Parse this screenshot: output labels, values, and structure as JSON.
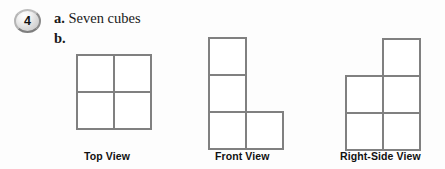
{
  "problem": {
    "number": "4",
    "part_a": {
      "marker": "a.",
      "text": "Seven cubes"
    },
    "part_b": {
      "marker": "b."
    }
  },
  "captions": {
    "top": "Top View",
    "front": "Front View",
    "right": "Right-Side View"
  },
  "style": {
    "line_color": "#808080",
    "line_width": "1.6",
    "fill_color": "#ffffff",
    "text_color": "#1a1a1a",
    "background": "#fdfdfd"
  },
  "chart_data": {
    "type": "diagram",
    "cell_size": 37,
    "views": [
      {
        "name": "top",
        "label": "Top View",
        "origin": {
          "x": 77,
          "y": 55
        },
        "rows": 2,
        "cols": 2,
        "cells": [
          {
            "col": 0,
            "row": 0
          },
          {
            "col": 1,
            "row": 0
          },
          {
            "col": 0,
            "row": 1
          },
          {
            "col": 1,
            "row": 1
          }
        ],
        "cell_count": 4
      },
      {
        "name": "front",
        "label": "Front View",
        "origin": {
          "x": 209,
          "y": 38
        },
        "rows": 3,
        "cols": 2,
        "cells": [
          {
            "col": 0,
            "row": 0
          },
          {
            "col": 0,
            "row": 1
          },
          {
            "col": 0,
            "row": 2
          },
          {
            "col": 1,
            "row": 2
          }
        ],
        "cell_count": 4,
        "shape": "L-shape"
      },
      {
        "name": "right",
        "label": "Right-Side View",
        "origin": {
          "x": 346,
          "y": 39
        },
        "rows": 3,
        "cols": 2,
        "cells": [
          {
            "col": 1,
            "row": 0
          },
          {
            "col": 0,
            "row": 1
          },
          {
            "col": 1,
            "row": 1
          },
          {
            "col": 0,
            "row": 2
          },
          {
            "col": 1,
            "row": 2
          }
        ],
        "cell_count": 5,
        "shape": "P-shape"
      }
    ]
  }
}
